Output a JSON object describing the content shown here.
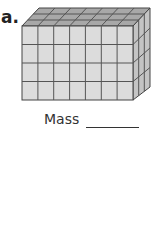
{
  "problem": {
    "label": "a.",
    "mass_label": "Mass",
    "answer_blank": ""
  },
  "figure": {
    "type": "rectangular-prism-of-unit-cubes",
    "front_columns": 7,
    "front_rows": 4,
    "depth": 3,
    "colors": {
      "front": "#dcdcdc",
      "top": "#a8a8a8",
      "side": "#c4c4c4",
      "line": "#444444"
    }
  }
}
